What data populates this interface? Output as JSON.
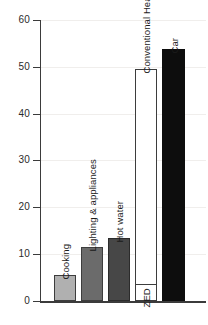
{
  "chart_data": {
    "type": "bar",
    "title": "",
    "subtitle": "",
    "xlabel": "",
    "ylabel": "",
    "ylim": [
      0,
      60
    ],
    "yticks": [
      0,
      10,
      20,
      30,
      40,
      50,
      60
    ],
    "ytick_labels": [
      "0",
      "10",
      "20",
      "30",
      "40",
      "50",
      "60"
    ],
    "grid": "horizontal-faint",
    "legend": "none",
    "categories": [
      "Cooking",
      "Lighting & appliances",
      "Hot water",
      "ZED",
      "Conventional Heating",
      "Car"
    ],
    "values": [
      5.5,
      11.6,
      13.4,
      3.6,
      49.5,
      53.8
    ],
    "bars": [
      {
        "label": "Cooking",
        "value": 5.5,
        "fill": "#b0b0b0",
        "stroke": "#3d3d3d",
        "x": 54,
        "width": 22
      },
      {
        "label": "Lighting & appliances",
        "value": 11.6,
        "fill": "#6b6b6b",
        "stroke": "#3d3d3d",
        "x": 81,
        "width": 22
      },
      {
        "label": "Hot water",
        "value": 13.4,
        "fill": "#474747",
        "stroke": "#2b2b2b",
        "x": 108,
        "width": 22
      },
      {
        "label": "Conventional Heating",
        "value": 49.5,
        "fill": "#ffffff",
        "stroke": "#3d3d3d",
        "x": 135,
        "width": 22
      },
      {
        "label": "ZED",
        "value": 3.6,
        "fill": "#ffffff",
        "stroke": "#3d3d3d",
        "x": 135,
        "width": 22
      },
      {
        "label": "Car",
        "value": 53.8,
        "fill": "#0d0d0d",
        "stroke": "#0d0d0d",
        "x": 162,
        "width": 23
      }
    ]
  },
  "axis": {
    "tick_0": "0",
    "tick_10": "10",
    "tick_20": "20",
    "tick_30": "30",
    "tick_40": "40",
    "tick_50": "50",
    "tick_60": "60"
  },
  "labels": {
    "cooking": "Cooking",
    "lighting": "Lighting & appliances",
    "hot_water": "Hot water",
    "conventional_heating": "Conventional Heating",
    "zed": "ZED",
    "car": "Car"
  },
  "colors": {
    "cooking_fill": "#b0b0b0",
    "lighting_fill": "#6b6b6b",
    "hot_water_fill": "#474747",
    "heating_fill": "#ffffff",
    "car_fill": "#0d0d0d",
    "axis": "#3b3b3b",
    "gridline": "#f0eeec",
    "background": "#ffffff"
  }
}
